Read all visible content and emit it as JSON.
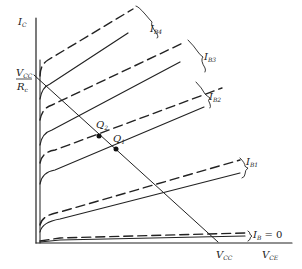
{
  "diagram": {
    "axes": {
      "y_label": "I",
      "y_label_sub": "C",
      "x_label": "V",
      "x_label_sub": "CE"
    },
    "load_line": {
      "y_intercept_num": "V",
      "y_intercept_num_sub": "CC",
      "y_intercept_den": "R",
      "y_intercept_den_sub": "c",
      "x_intercept": "V",
      "x_intercept_sub": "CC"
    },
    "curve_labels": [
      {
        "main": "I",
        "sub": "B4"
      },
      {
        "main": "I",
        "sub": "B3"
      },
      {
        "main": "I",
        "sub": "B2"
      },
      {
        "main": "I",
        "sub": "B1"
      },
      {
        "main": "I",
        "sub": "B",
        "suffix": " = 0"
      }
    ],
    "q_points": [
      {
        "main": "Q",
        "sub": "2"
      },
      {
        "main": "Q",
        "sub": "1"
      }
    ],
    "colors": {
      "line": "#222222",
      "background": "#ffffff"
    }
  }
}
